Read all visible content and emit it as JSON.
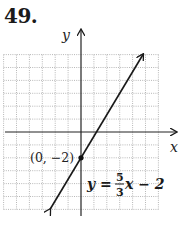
{
  "problem_number": "49.",
  "chart_data": {
    "type": "line",
    "title": "",
    "xlabel": "x",
    "ylabel": "y",
    "xlim": [
      -6,
      6
    ],
    "ylim": [
      -6,
      6
    ],
    "grid": true,
    "equation": "y = 5/3 x - 2",
    "slope": "5/3",
    "intercept": -2,
    "series": [
      {
        "name": "y = (5/3)x - 2",
        "x": [
          -2.4,
          4.8
        ],
        "y": [
          -6,
          6
        ]
      }
    ],
    "points": [
      {
        "label": "(0, −2)",
        "x": 0,
        "y": -2
      }
    ],
    "annotations": {
      "point_label": "(0, −2)",
      "equation_lhs": "y =",
      "equation_num": "5",
      "equation_den": "3",
      "equation_rhs": "x − 2"
    }
  },
  "colors": {
    "line": "#1a1a1a",
    "grid": "#9a9a9a",
    "axis": "#222222"
  }
}
